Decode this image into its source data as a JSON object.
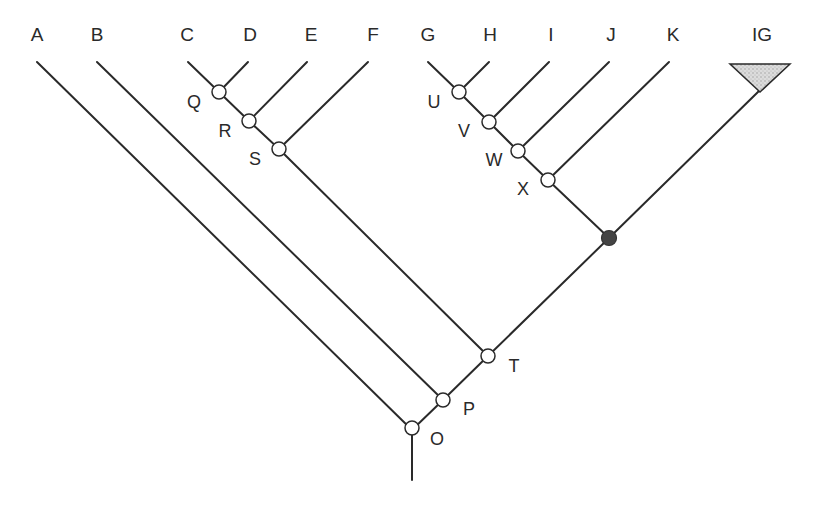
{
  "diagram": {
    "type": "cladogram",
    "tip_labels": {
      "A": "A",
      "B": "B",
      "C": "C",
      "D": "D",
      "E": "E",
      "F": "F",
      "G": "G",
      "H": "H",
      "I": "I",
      "J": "J",
      "K": "K",
      "IG": "IG"
    },
    "node_labels": {
      "O": "O",
      "P": "P",
      "Q": "Q",
      "R": "R",
      "S": "S",
      "T": "T",
      "U": "U",
      "V": "V",
      "W": "W",
      "X": "X"
    },
    "topology": {
      "O": [
        "A",
        "P"
      ],
      "P": [
        "B",
        "T"
      ],
      "T": [
        "S",
        "ancestor"
      ],
      "S": [
        "R",
        "F"
      ],
      "R": [
        "Q",
        "E"
      ],
      "Q": [
        "C",
        "D"
      ],
      "ancestor": [
        "X",
        "IG"
      ],
      "X": [
        "W",
        "K"
      ],
      "W": [
        "V",
        "J"
      ],
      "V": [
        "U",
        "I"
      ],
      "U": [
        "G",
        "H"
      ]
    },
    "highlighted_node": "ancestor",
    "collapsed_clade": "IG",
    "colors": {
      "line": "#2a2a2a",
      "open_node_fill": "#ffffff",
      "filled_node": "#444444",
      "collapsed_clade_fill": "#cfcfcf"
    }
  }
}
